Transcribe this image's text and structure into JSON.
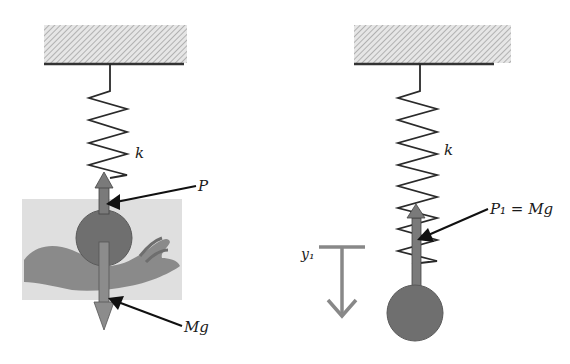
{
  "diagram": {
    "type": "spring-mass static equilibrium",
    "left_panel": {
      "spring_label": "k",
      "force_up_label": "P",
      "force_down_label": "Mg",
      "support": "hand holding mass"
    },
    "right_panel": {
      "spring_label": "k",
      "force_label": "P₁ = Mg",
      "displacement_label": "y₁"
    },
    "colors": {
      "ceiling_hatch": "#9a9a9a",
      "ceiling_line": "#333333",
      "spring": "#2a2a2a",
      "mass": "#6f6f6f",
      "arrow_fill": "#858585",
      "photo_bg": "#e2e2e2",
      "hand": "#8a8a8a"
    }
  }
}
